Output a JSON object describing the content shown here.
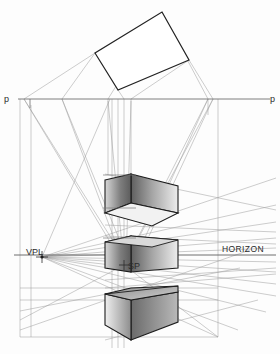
{
  "diagram": {
    "canvas": {
      "width": 280,
      "height": 354,
      "background": "#fdfdfd"
    },
    "labels": {
      "picture_plane_left": "p",
      "picture_plane_right": "p",
      "vanishing_point_left": "VPL",
      "station_point": "SP",
      "horizon": "HORIZON"
    },
    "colors": {
      "construction_line": "#8a8a8a",
      "faint_line": "#b3b3b3",
      "object_outline": "#1c1c1c",
      "face_dark": "#6d6d6d",
      "face_mid": "#9a9a9a",
      "face_light": "#e8e8e8",
      "label_text": "#2b2b2b",
      "plan_outline": "#222222"
    },
    "geometry": {
      "picture_plane_line": {
        "y": 99,
        "x1": 18,
        "x2": 270
      },
      "horizon_line": {
        "y": 255,
        "x1": 14,
        "x2": 276
      },
      "vanishing_point_left": {
        "x": 42,
        "y": 257
      },
      "station_point": {
        "x": 124,
        "y": 265
      },
      "plan_rectangle": [
        {
          "x": 162,
          "y": 12
        },
        {
          "x": 189,
          "y": 60
        },
        {
          "x": 118,
          "y": 90
        },
        {
          "x": 95,
          "y": 53
        }
      ],
      "boxes": [
        {
          "name": "upper-box",
          "top": 174,
          "bottom": 225,
          "left": 105,
          "right": 178
        },
        {
          "name": "middle-box",
          "top": 236,
          "bottom": 280,
          "left": 105,
          "right": 178
        },
        {
          "name": "lower-box",
          "top": 288,
          "bottom": 340,
          "left": 105,
          "right": 178
        }
      ],
      "outer_frame": {
        "x1": 20,
        "y1": 99,
        "x2": 218,
        "y2": 337
      }
    },
    "element_names": {
      "plan_view": "plan-rectangle",
      "upper_box": "perspective-box-upper",
      "middle_box": "perspective-box-middle",
      "lower_box": "perspective-box-lower"
    }
  }
}
